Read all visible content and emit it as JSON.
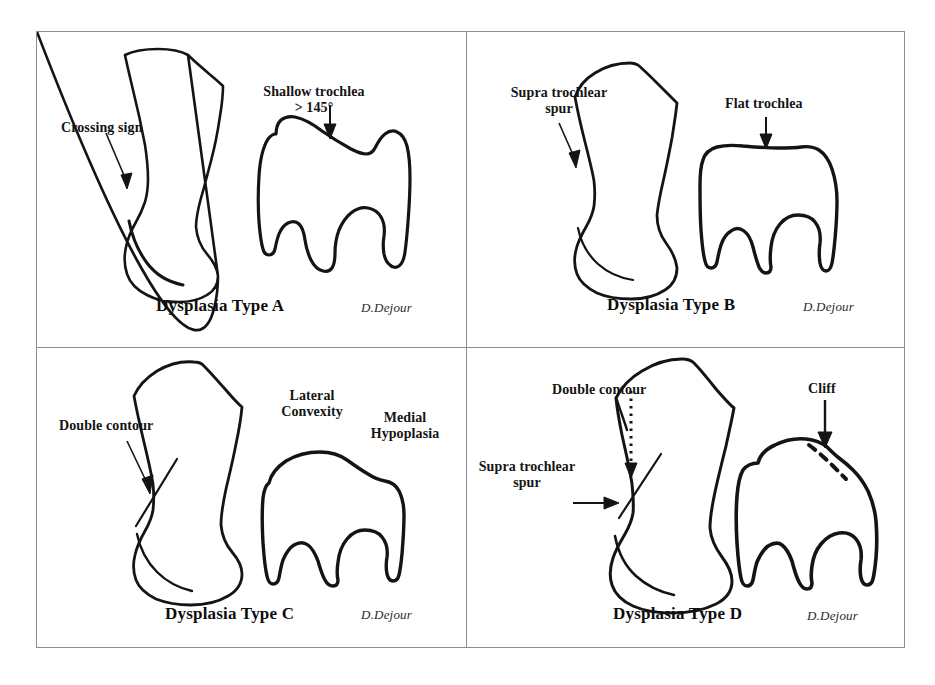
{
  "figure": {
    "background_color": "#ffffff",
    "frame_color": "#8c8c92",
    "ink_color": "#111111",
    "panel_count": 4
  },
  "panels": [
    {
      "id": "panel-a",
      "title": "Dysplasia Type A",
      "signature": "D.Dejour",
      "annotations": [
        {
          "name": "crossing-sign",
          "text": "Crossing sign",
          "arrow": "diagonal-down-right",
          "arrow_style": "solid"
        },
        {
          "name": "shallow-trochlea",
          "text": "Shallow trochlea",
          "text_line2": "> 145°",
          "arrow": "down",
          "arrow_style": "solid"
        }
      ]
    },
    {
      "id": "panel-b",
      "title": "Dysplasia Type B",
      "signature": "D.Dejour",
      "annotations": [
        {
          "name": "supra-trochlear-spur",
          "text": "Supra trochlear",
          "text_line2": "spur",
          "arrow": "diagonal-down-right",
          "arrow_style": "solid"
        },
        {
          "name": "flat-trochlea",
          "text": "Flat trochlea",
          "arrow": "down",
          "arrow_style": "solid"
        }
      ]
    },
    {
      "id": "panel-c",
      "title": "Dysplasia Type C",
      "signature": "D.Dejour",
      "annotations": [
        {
          "name": "double-contour",
          "text": "Double contour",
          "arrow": "diagonal-down-right",
          "arrow_style": "solid"
        },
        {
          "name": "lateral-convexity",
          "text": "Lateral",
          "text_line2": "Convexity",
          "arrow": "none",
          "arrow_style": "none"
        },
        {
          "name": "medial-hypoplasia",
          "text": "Medial",
          "text_line2": "Hypoplasia",
          "arrow": "none",
          "arrow_style": "none"
        }
      ]
    },
    {
      "id": "panel-d",
      "title": "Dysplasia Type D",
      "signature": "D.Dejour",
      "annotations": [
        {
          "name": "double-contour",
          "text": "Double contour",
          "arrow": "down",
          "arrow_style": "dotted"
        },
        {
          "name": "supra-trochlear-spur",
          "text": "Supra trochlear",
          "text_line2": "spur",
          "arrow": "right",
          "arrow_style": "solid"
        },
        {
          "name": "cliff",
          "text": "Cliff",
          "arrow": "down",
          "arrow_style": "solid"
        }
      ]
    }
  ]
}
